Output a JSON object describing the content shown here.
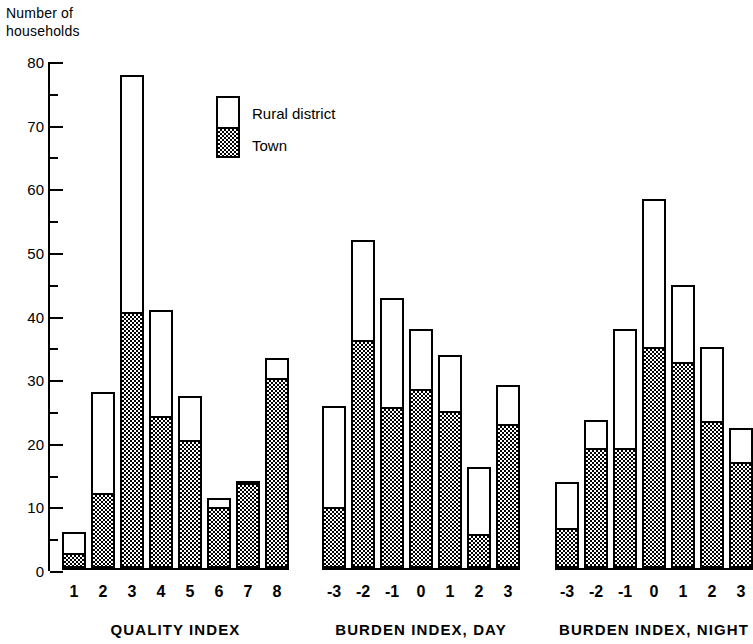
{
  "axis": {
    "ylabel_text": "Number of\nhouseholds",
    "yticks": [
      0,
      10,
      20,
      30,
      40,
      50,
      60,
      70,
      80
    ],
    "ymin": 0,
    "ymax": 80,
    "minor_tick_step": 5
  },
  "legend": {
    "rural_label": "Rural district",
    "town_label": "Town"
  },
  "groups": [
    {
      "title": "QUALITY INDEX",
      "categories": [
        "1",
        "2",
        "3",
        "4",
        "5",
        "6",
        "7",
        "8"
      ],
      "town": [
        2.0,
        11.5,
        40.0,
        23.5,
        19.8,
        9.3,
        13.7,
        29.5
      ],
      "rural": [
        3.6,
        16.2,
        37.5,
        17.0,
        7.2,
        1.7,
        0.0,
        3.5
      ],
      "totals": [
        5.6,
        27.7,
        77.5,
        40.5,
        27.0,
        11.0,
        13.7,
        33.0
      ]
    },
    {
      "title": "BURDEN INDEX, DAY",
      "categories": [
        "-3",
        "-2",
        "-1",
        "0",
        "1",
        "2",
        "3"
      ],
      "town": [
        9.3,
        35.5,
        25.0,
        27.8,
        24.3,
        5.0,
        22.3
      ],
      "rural": [
        16.2,
        16.0,
        17.5,
        9.7,
        9.2,
        10.8,
        6.4
      ],
      "totals": [
        25.5,
        51.5,
        42.5,
        37.5,
        33.5,
        15.8,
        28.7
      ]
    },
    {
      "title": "BURDEN INDEX, NIGHT",
      "categories": [
        "-3",
        "-2",
        "-1",
        "0",
        "1",
        "2",
        "3"
      ],
      "town": [
        6.0,
        18.5,
        18.5,
        34.5,
        32.0,
        22.8,
        16.3
      ],
      "rural": [
        7.5,
        4.8,
        19.0,
        23.5,
        12.5,
        12.0,
        5.7
      ],
      "totals": [
        13.5,
        23.3,
        37.5,
        58.0,
        44.5,
        34.8,
        22.0
      ]
    }
  ],
  "chart_data": {
    "type": "bar",
    "title": "",
    "subtitle": "",
    "xlabel": "",
    "ylabel": "Number of households",
    "ylim": [
      0,
      80
    ],
    "ytick_step": 10,
    "minor_tick_step": 5,
    "grid": false,
    "stacked": true,
    "legend_position": "inside-top-left",
    "legend_entries": [
      "Rural district",
      "Town"
    ],
    "colors": {
      "rural_district": "#ffffff",
      "town": "#000000",
      "axis": "#000000",
      "background": "#ffffff"
    },
    "panels": [
      {
        "name": "QUALITY INDEX",
        "xlabel": "QUALITY INDEX",
        "categories": [
          "1",
          "2",
          "3",
          "4",
          "5",
          "6",
          "7",
          "8"
        ],
        "series": [
          {
            "name": "Town",
            "values": [
              2.0,
              11.5,
              40.0,
              23.5,
              19.8,
              9.3,
              13.7,
              29.5
            ]
          },
          {
            "name": "Rural district",
            "values": [
              3.6,
              16.2,
              37.5,
              17.0,
              7.2,
              1.7,
              0.0,
              3.5
            ]
          }
        ],
        "totals": [
          5.6,
          27.7,
          77.5,
          40.5,
          27.0,
          11.0,
          13.7,
          33.0
        ]
      },
      {
        "name": "BURDEN INDEX, DAY",
        "xlabel": "BURDEN INDEX, DAY",
        "categories": [
          "-3",
          "-2",
          "-1",
          "0",
          "1",
          "2",
          "3"
        ],
        "series": [
          {
            "name": "Town",
            "values": [
              9.3,
              35.5,
              25.0,
              27.8,
              24.3,
              5.0,
              22.3
            ]
          },
          {
            "name": "Rural district",
            "values": [
              16.2,
              16.0,
              17.5,
              9.7,
              9.2,
              10.8,
              6.4
            ]
          }
        ],
        "totals": [
          25.5,
          51.5,
          42.5,
          37.5,
          33.5,
          15.8,
          28.7
        ]
      },
      {
        "name": "BURDEN INDEX, NIGHT",
        "xlabel": "BURDEN INDEX, NIGHT",
        "categories": [
          "-3",
          "-2",
          "-1",
          "0",
          "1",
          "2",
          "3"
        ],
        "series": [
          {
            "name": "Town",
            "values": [
              6.0,
              18.5,
              18.5,
              34.5,
              32.0,
              22.8,
              16.3
            ]
          },
          {
            "name": "Rural district",
            "values": [
              7.5,
              4.8,
              19.0,
              23.5,
              12.5,
              12.0,
              5.7
            ]
          }
        ],
        "totals": [
          13.5,
          23.3,
          37.5,
          58.0,
          44.5,
          34.8,
          22.0
        ]
      }
    ]
  }
}
